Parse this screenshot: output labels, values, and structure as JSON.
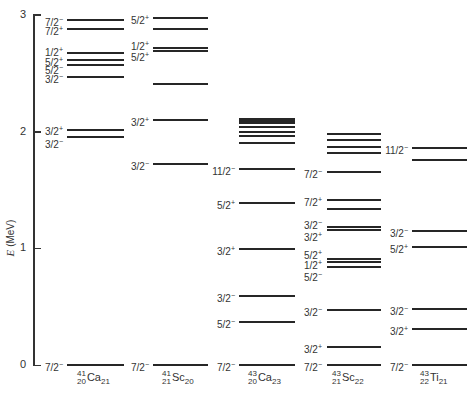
{
  "axis": {
    "title_symbol": "E",
    "title_unit": "(MeV)",
    "ticks": [
      {
        "value": 0,
        "label": "0"
      },
      {
        "value": 1,
        "label": "1"
      },
      {
        "value": 2,
        "label": "2"
      },
      {
        "value": 3,
        "label": "3"
      }
    ],
    "range": [
      0,
      3
    ]
  },
  "columns": [
    {
      "id": "ca41",
      "A": "41",
      "Z": "20",
      "symbol": "Ca",
      "N": "21",
      "levels": [
        {
          "E": 0.0,
          "spin": "7/2",
          "parity": "−"
        },
        {
          "E": 1.95,
          "spin": "3/2",
          "parity": "−"
        },
        {
          "E": 2.01,
          "spin": "3/2",
          "parity": "+"
        },
        {
          "E": 2.47,
          "spin": "3/2",
          "parity": "−"
        },
        {
          "E": 2.57,
          "spin": "5/2",
          "parity": "−"
        },
        {
          "E": 2.61,
          "spin": "5/2",
          "parity": "+"
        },
        {
          "E": 2.67,
          "spin": "1/2",
          "parity": "+"
        },
        {
          "E": 2.88,
          "spin": "7/2",
          "parity": "+"
        },
        {
          "E": 2.96,
          "spin": "7/2",
          "parity": "−"
        }
      ]
    },
    {
      "id": "sc41",
      "A": "41",
      "Z": "21",
      "symbol": "Sc",
      "N": "20",
      "levels": [
        {
          "E": 0.0,
          "spin": "7/2",
          "parity": "−"
        },
        {
          "E": 1.72,
          "spin": "3/2",
          "parity": "−"
        },
        {
          "E": 2.1,
          "spin": "3/2",
          "parity": "+"
        },
        {
          "E": 2.41,
          "spin": "",
          "parity": ""
        },
        {
          "E": 2.69,
          "spin": "5/2",
          "parity": "+"
        },
        {
          "E": 2.72,
          "spin": "1/2",
          "parity": "+"
        },
        {
          "E": 2.88,
          "spin": "",
          "parity": ""
        },
        {
          "E": 2.97,
          "spin": "5/2",
          "parity": "+"
        }
      ]
    },
    {
      "id": "ca43",
      "A": "43",
      "Z": "20",
      "symbol": "Ca",
      "N": "23",
      "levels": [
        {
          "E": 0.0,
          "spin": "7/2",
          "parity": "−"
        },
        {
          "E": 0.37,
          "spin": "5/2",
          "parity": "−"
        },
        {
          "E": 0.59,
          "spin": "3/2",
          "parity": "−"
        },
        {
          "E": 0.99,
          "spin": "3/2",
          "parity": "+"
        },
        {
          "E": 1.39,
          "spin": "5/2",
          "parity": "+"
        },
        {
          "E": 1.68,
          "spin": "11/2",
          "parity": "−"
        },
        {
          "E": 1.9,
          "spin": "",
          "parity": ""
        },
        {
          "E": 1.96,
          "spin": "",
          "parity": ""
        },
        {
          "E": 2.0,
          "spin": "",
          "parity": ""
        },
        {
          "E": 2.04,
          "spin": "",
          "parity": ""
        },
        {
          "E": 2.07,
          "spin": "",
          "parity": ""
        },
        {
          "E": 2.09,
          "spin": "",
          "parity": ""
        },
        {
          "E": 2.11,
          "spin": "",
          "parity": ""
        }
      ]
    },
    {
      "id": "sc43",
      "A": "43",
      "Z": "21",
      "symbol": "Sc",
      "N": "22",
      "levels": [
        {
          "E": 0.0,
          "spin": "7/2",
          "parity": "−"
        },
        {
          "E": 0.15,
          "spin": "3/2",
          "parity": "+"
        },
        {
          "E": 0.47,
          "spin": "3/2",
          "parity": "−"
        },
        {
          "E": 0.84,
          "spin": "5/2",
          "parity": "−"
        },
        {
          "E": 0.88,
          "spin": "1/2",
          "parity": "+"
        },
        {
          "E": 0.91,
          "spin": "5/2",
          "parity": "+"
        },
        {
          "E": 1.16,
          "spin": "3/2",
          "parity": "+"
        },
        {
          "E": 1.18,
          "spin": "3/2",
          "parity": "−"
        },
        {
          "E": 1.34,
          "spin": "",
          "parity": ""
        },
        {
          "E": 1.41,
          "spin": "7/2",
          "parity": "+"
        },
        {
          "E": 1.65,
          "spin": "7/2",
          "parity": "−"
        },
        {
          "E": 1.82,
          "spin": "",
          "parity": ""
        },
        {
          "E": 1.87,
          "spin": "",
          "parity": ""
        },
        {
          "E": 1.93,
          "spin": "",
          "parity": ""
        },
        {
          "E": 1.98,
          "spin": "",
          "parity": ""
        }
      ]
    },
    {
      "id": "ti43",
      "A": "43",
      "Z": "22",
      "symbol": "Ti",
      "N": "21",
      "levels": [
        {
          "E": 0.0,
          "spin": "7/2",
          "parity": "−"
        },
        {
          "E": 0.31,
          "spin": "3/2",
          "parity": "+"
        },
        {
          "E": 0.48,
          "spin": "3/2",
          "parity": "−"
        },
        {
          "E": 1.01,
          "spin": "5/2",
          "parity": "+"
        },
        {
          "E": 1.15,
          "spin": "3/2",
          "parity": "−"
        },
        {
          "E": 1.76,
          "spin": "",
          "parity": ""
        },
        {
          "E": 1.86,
          "spin": "11/2",
          "parity": "−"
        }
      ]
    }
  ],
  "chart_data": {
    "type": "level-scheme",
    "title": "",
    "ylabel": "E (MeV)",
    "ylim": [
      0,
      3
    ],
    "yticks": [
      0,
      1,
      2,
      3
    ],
    "categories": [
      "41/20 Ca 21",
      "41/21 Sc 20",
      "43/20 Ca 23",
      "43/21 Sc 22",
      "43/22 Ti 21"
    ],
    "series": [
      {
        "name": "41Ca",
        "energies": [
          0.0,
          1.95,
          2.01,
          2.47,
          2.57,
          2.61,
          2.67,
          2.88,
          2.96
        ],
        "labels": [
          "7/2-",
          "3/2-",
          "3/2+",
          "3/2-",
          "5/2-",
          "5/2+",
          "1/2+",
          "7/2+",
          "7/2-"
        ]
      },
      {
        "name": "41Sc",
        "energies": [
          0.0,
          1.72,
          2.1,
          2.41,
          2.69,
          2.72,
          2.88,
          2.97
        ],
        "labels": [
          "7/2-",
          "3/2-",
          "3/2+",
          "",
          "5/2+",
          "1/2+",
          "",
          "5/2+"
        ]
      },
      {
        "name": "43Ca",
        "energies": [
          0.0,
          0.37,
          0.59,
          0.99,
          1.39,
          1.68,
          1.9,
          1.96,
          2.0,
          2.04,
          2.07,
          2.09,
          2.11
        ],
        "labels": [
          "7/2-",
          "5/2-",
          "3/2-",
          "3/2+",
          "5/2+",
          "11/2-",
          "",
          "",
          "",
          "",
          "",
          "",
          ""
        ]
      },
      {
        "name": "43Sc",
        "energies": [
          0.0,
          0.15,
          0.47,
          0.84,
          0.88,
          0.91,
          1.16,
          1.18,
          1.34,
          1.41,
          1.65,
          1.82,
          1.87,
          1.93,
          1.98
        ],
        "labels": [
          "7/2-",
          "3/2+",
          "3/2-",
          "5/2-",
          "1/2+",
          "5/2+",
          "3/2+",
          "3/2-",
          "",
          "7/2+",
          "7/2-",
          "",
          "",
          "",
          ""
        ]
      },
      {
        "name": "43Ti",
        "energies": [
          0.0,
          0.31,
          0.48,
          1.01,
          1.15,
          1.76,
          1.86
        ],
        "labels": [
          "7/2-",
          "3/2+",
          "3/2-",
          "5/2+",
          "3/2-",
          "",
          "11/2-"
        ]
      }
    ]
  }
}
